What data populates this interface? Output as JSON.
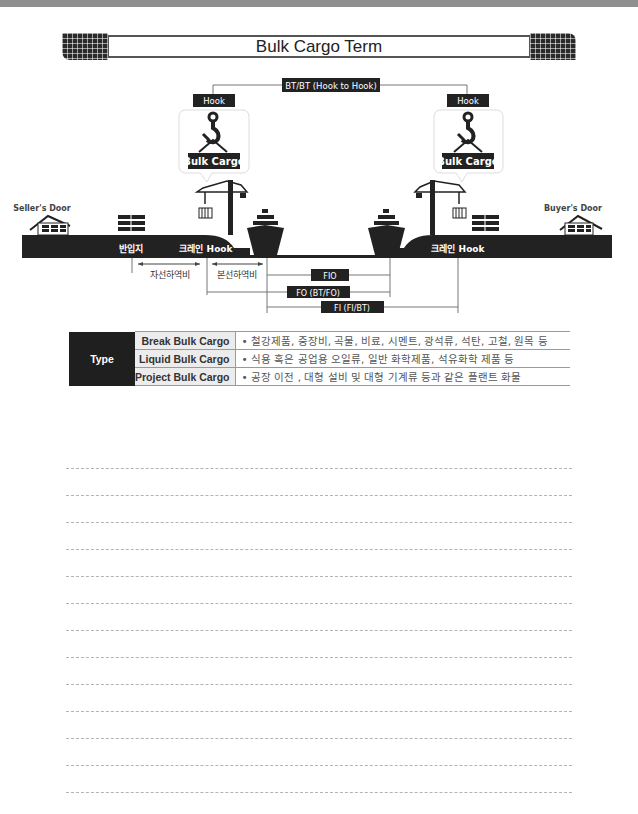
{
  "title": "Bulk Cargo Term",
  "diagram": {
    "bt_bt_label": "BT/BT (Hook to Hook)",
    "hook_left_label": "Hook",
    "hook_right_label": "Hook",
    "bulk_cargo_left_label": "Bulk Cargo",
    "bulk_cargo_right_label": "Bulk Cargo",
    "sellers_door": "Seller's Door",
    "buyers_door": "Buyer's Door",
    "bangipji": "반입지",
    "crane_hook_left": "크레인 Hook",
    "crane_hook_right": "크레인 Hook",
    "jaseon_cost": "자선하역비",
    "bonseon_cost": "본선하역비",
    "fio_label": "FIO",
    "fo_label": "FO (BT/FO)",
    "fi_label": "FI (FI/BT)"
  },
  "type_table": {
    "header": "Type",
    "rows": [
      {
        "name": "Break Bulk Cargo",
        "desc": "• 철강제품, 중장비, 곡물, 비료, 시멘트, 광석류, 석탄, 고철, 원목 등"
      },
      {
        "name": "Liquid Bulk Cargo",
        "desc": "• 식용 혹은 공업용 오일류, 일반 화학제품, 석유화학 제품 등"
      },
      {
        "name": "Project Bulk Cargo",
        "desc": "• 공장 이전 , 대형 설비 및 대형 기계류 등과 같은 플랜트 화물"
      }
    ]
  },
  "note_line_count": 14,
  "colors": {
    "dark": "#222222",
    "line": "#666666",
    "table_border": "#9a9a9a",
    "top_bar": "#8f8f8f"
  }
}
